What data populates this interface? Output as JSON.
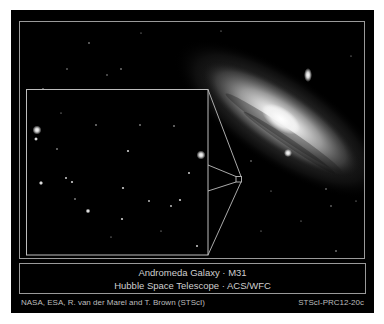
{
  "image": {
    "subject": "Andromeda galaxy with inset star field",
    "colors": {
      "background": "#000000",
      "border": "#ffffff",
      "frame_line": "#9a9a9a",
      "text": "#cfcfcf"
    }
  },
  "caption": {
    "line1": "Andromeda Galaxy · M31",
    "line2": "Hubble Space Telescope · ACS/WFC"
  },
  "credits": {
    "left": "NASA, ESA, R. van der Marel and T. Brown (STScI)",
    "right": "STScI-PRC12-20c"
  }
}
